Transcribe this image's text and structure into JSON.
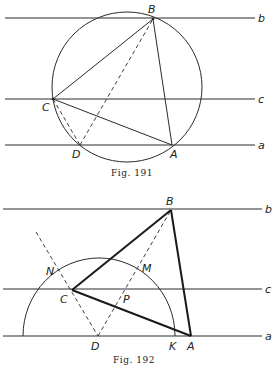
{
  "figures": [
    {
      "caption": "Fig. 191",
      "lines": {
        "b": "b",
        "c": "c",
        "a": "a"
      },
      "points": {
        "B": "B",
        "C": "C",
        "D": "D",
        "A": "A"
      }
    },
    {
      "caption": "Fig. 192",
      "lines": {
        "b": "b",
        "c": "c",
        "a": "a"
      },
      "points": {
        "B": "B",
        "C": "C",
        "D": "D",
        "A": "A",
        "N": "N",
        "M": "M",
        "P": "P",
        "K": "K"
      }
    }
  ]
}
